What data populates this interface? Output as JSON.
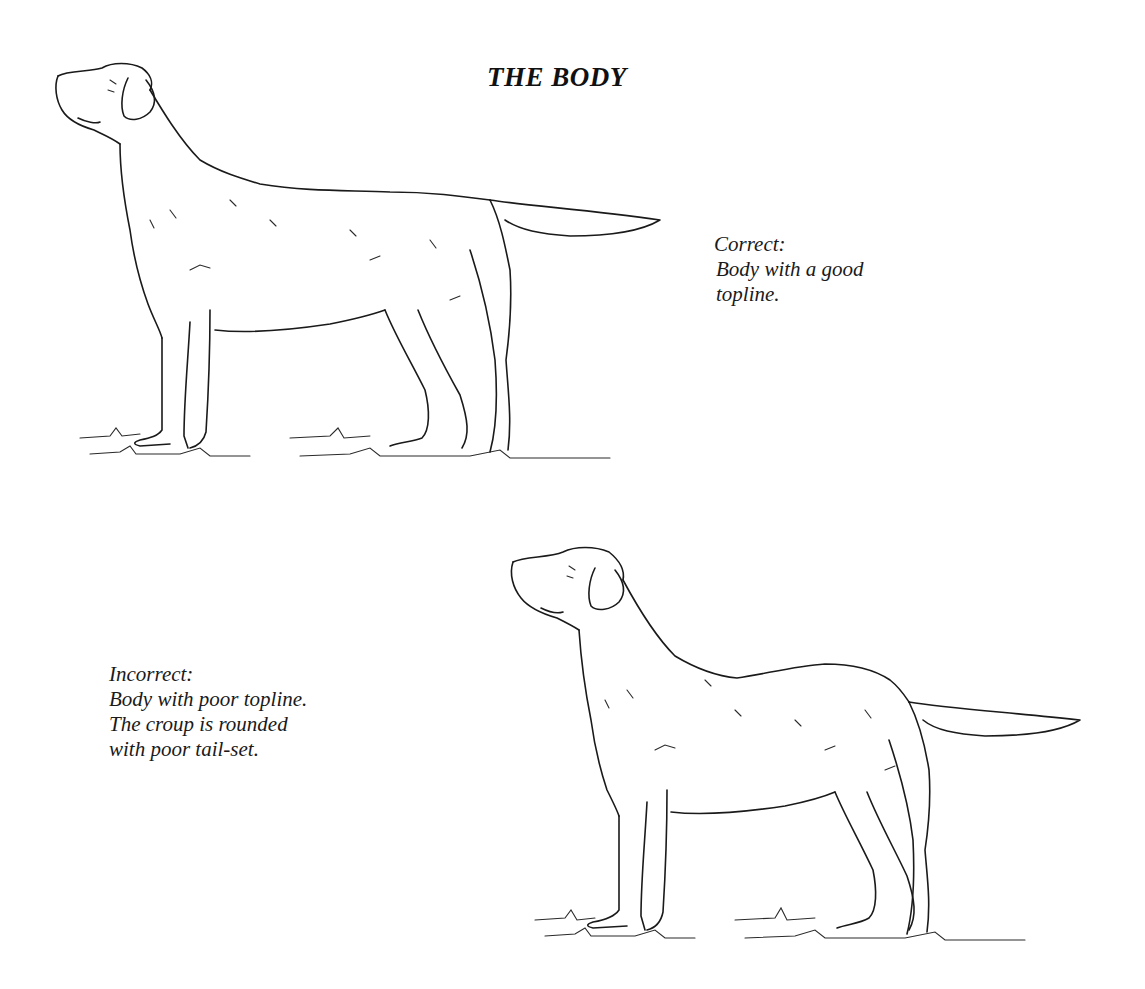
{
  "page": {
    "title": "THE BODY"
  },
  "figures": [
    {
      "id": "correct",
      "subject": "dog-standing-profile",
      "caption": {
        "label": "Correct:",
        "lines": [
          "Body with a good",
          "topline."
        ]
      }
    },
    {
      "id": "incorrect",
      "subject": "dog-standing-profile",
      "caption": {
        "label": "Incorrect:",
        "lines": [
          "Body with poor topline.",
          "The croup is rounded",
          "with poor tail-set."
        ]
      }
    }
  ],
  "colors": {
    "background": "#ffffff",
    "ink": "#1a1a1a"
  }
}
